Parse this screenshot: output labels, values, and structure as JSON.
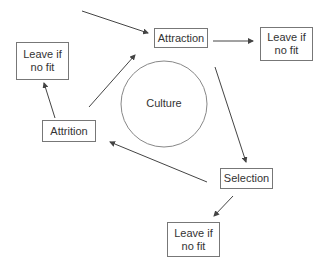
{
  "diagram": {
    "center": {
      "label": "Culture"
    },
    "nodes": {
      "attraction": {
        "label": "Attraction"
      },
      "selection": {
        "label": "Selection"
      },
      "attrition": {
        "label": "Attrition"
      },
      "leave_right": {
        "label": "Leave if no fit"
      },
      "leave_left": {
        "label": "Leave if no fit"
      },
      "leave_bottom": {
        "label": "Leave if no fit"
      }
    },
    "edges": [
      {
        "from": "outside",
        "to": "attraction"
      },
      {
        "from": "attraction",
        "to": "leave_right"
      },
      {
        "from": "attraction",
        "to": "selection"
      },
      {
        "from": "selection",
        "to": "attrition"
      },
      {
        "from": "selection",
        "to": "leave_bottom"
      },
      {
        "from": "attrition",
        "to": "attraction"
      },
      {
        "from": "attrition",
        "to": "leave_left"
      }
    ],
    "colors": {
      "line": "#444444",
      "box_border": "#777777",
      "text": "#333333"
    }
  }
}
